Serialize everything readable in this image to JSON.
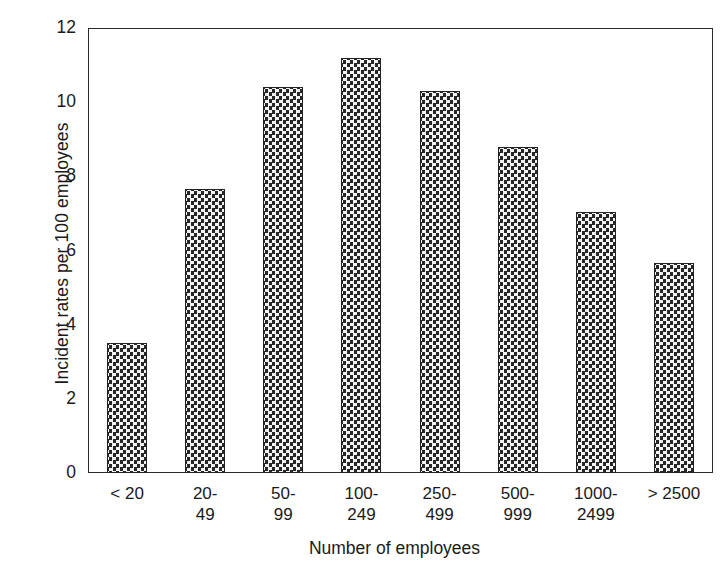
{
  "chart_data": {
    "type": "bar",
    "title": "",
    "xlabel": "Number of employees",
    "ylabel": "Incident rates per 100 employees",
    "categories": [
      "< 20",
      "20-49",
      "50-99",
      "100-249",
      "250-499",
      "500-999",
      "1000-2499",
      "> 2500"
    ],
    "category_lines": [
      {
        "line1": "< 20",
        "line2": ""
      },
      {
        "line1": "20-",
        "line2": "49"
      },
      {
        "line1": "50-",
        "line2": "99"
      },
      {
        "line1": "100-",
        "line2": "249"
      },
      {
        "line1": "250-",
        "line2": "499"
      },
      {
        "line1": "500-",
        "line2": "999"
      },
      {
        "line1": "1000-",
        "line2": "2499"
      },
      {
        "line1": "> 2500",
        "line2": ""
      }
    ],
    "values": [
      3.5,
      7.65,
      10.4,
      11.2,
      10.3,
      8.8,
      7.05,
      5.65
    ],
    "ylim": [
      0,
      12
    ],
    "yticks": [
      0,
      2,
      4,
      6,
      8,
      10,
      12
    ],
    "ytick_labels": [
      "0",
      "2",
      "4",
      "6",
      "8",
      "10",
      "12"
    ],
    "grid": false,
    "legend": "none",
    "bar_fill": "#2b2b2b",
    "bar_pattern": "checkerboard-dots",
    "axis_color": "#2b2b2b"
  },
  "axis": {
    "y_title": "Incident rates per 100 employees",
    "x_title": "Number of employees"
  }
}
